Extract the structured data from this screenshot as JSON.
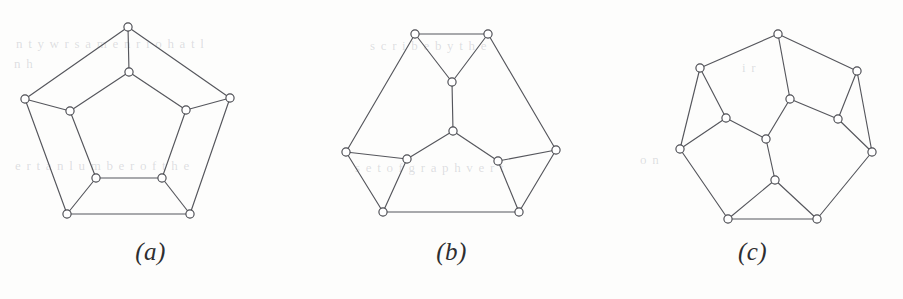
{
  "figure": {
    "background_color": "#fdfdfc",
    "edge_color": "#55565c",
    "node_fill": "#ffffff",
    "node_stroke": "#4a4b51",
    "node_radius": 4.1,
    "caption_color": "#2e2e30",
    "ghost_color": "rgba(145,148,160,0.30)"
  },
  "ghost_marks": [
    {
      "text": "n t  y  w  r  s  a  m  e  n  r  i  o  h  a  t  l",
      "x": 16,
      "y": 36
    },
    {
      "text": "n h",
      "x": 14,
      "y": 56
    },
    {
      "text": "e  r  t  a  n   l   u  m  b  e  r  o  f   t  h  e",
      "x": 15,
      "y": 158
    },
    {
      "text": "s  c  r  i  b  e   b  y   t  h  e",
      "x": 370,
      "y": 38
    },
    {
      "text": "s  e  t   o f   g r a p h   v e r t",
      "x": 355,
      "y": 160
    },
    {
      "text": "i  r",
      "x": 742,
      "y": 60
    },
    {
      "text": "o  n",
      "x": 640,
      "y": 152
    }
  ],
  "panels": [
    {
      "id": "panel-a",
      "caption": "(a)",
      "left": 0,
      "graph_name": "pentagonal-prism-graph",
      "nodes": [
        {
          "name": "outer-top",
          "x": 128,
          "y": 27
        },
        {
          "name": "outer-left",
          "x": 25,
          "y": 99
        },
        {
          "name": "outer-right",
          "x": 230,
          "y": 98
        },
        {
          "name": "outer-bottom-left",
          "x": 67,
          "y": 214
        },
        {
          "name": "outer-bottom-right",
          "x": 190,
          "y": 214
        },
        {
          "name": "inner-top",
          "x": 129,
          "y": 72
        },
        {
          "name": "inner-left",
          "x": 70,
          "y": 111
        },
        {
          "name": "inner-right",
          "x": 186,
          "y": 110
        },
        {
          "name": "inner-bottom-left",
          "x": 96,
          "y": 178
        },
        {
          "name": "inner-bottom-right",
          "x": 162,
          "y": 178
        }
      ],
      "edges": [
        [
          0,
          1
        ],
        [
          0,
          2
        ],
        [
          1,
          3
        ],
        [
          2,
          4
        ],
        [
          3,
          4
        ],
        [
          5,
          6
        ],
        [
          5,
          7
        ],
        [
          6,
          8
        ],
        [
          7,
          9
        ],
        [
          8,
          9
        ],
        [
          0,
          5
        ],
        [
          1,
          6
        ],
        [
          2,
          7
        ],
        [
          3,
          8
        ],
        [
          4,
          9
        ]
      ]
    },
    {
      "id": "panel-b",
      "caption": "(b)",
      "left": 301,
      "graph_name": "hexagonal-three-spoke-graph",
      "nodes": [
        {
          "name": "outer-top-left",
          "x": 114,
          "y": 34
        },
        {
          "name": "outer-top-right",
          "x": 187,
          "y": 34
        },
        {
          "name": "outer-left",
          "x": 45,
          "y": 152
        },
        {
          "name": "outer-right",
          "x": 255,
          "y": 150
        },
        {
          "name": "outer-bottom-left",
          "x": 82,
          "y": 212
        },
        {
          "name": "outer-bottom-right",
          "x": 218,
          "y": 212
        },
        {
          "name": "inner-top",
          "x": 151,
          "y": 82
        },
        {
          "name": "center",
          "x": 152,
          "y": 131
        },
        {
          "name": "inner-left",
          "x": 106,
          "y": 159
        },
        {
          "name": "inner-right",
          "x": 197,
          "y": 161
        }
      ],
      "edges": [
        [
          0,
          1
        ],
        [
          0,
          2
        ],
        [
          1,
          3
        ],
        [
          2,
          4
        ],
        [
          3,
          5
        ],
        [
          4,
          5
        ],
        [
          0,
          6
        ],
        [
          1,
          6
        ],
        [
          6,
          7
        ],
        [
          2,
          8
        ],
        [
          4,
          8
        ],
        [
          8,
          7
        ],
        [
          3,
          9
        ],
        [
          5,
          9
        ],
        [
          9,
          7
        ]
      ]
    },
    {
      "id": "panel-c",
      "caption": "(c)",
      "left": 602,
      "graph_name": "heptagonal-dodecahedral-graph",
      "nodes": [
        {
          "name": "outer-top",
          "x": 176,
          "y": 34
        },
        {
          "name": "outer-upper-left",
          "x": 98,
          "y": 68
        },
        {
          "name": "outer-upper-right",
          "x": 255,
          "y": 71
        },
        {
          "name": "outer-left",
          "x": 78,
          "y": 149
        },
        {
          "name": "outer-right",
          "x": 270,
          "y": 152
        },
        {
          "name": "outer-bottom-left",
          "x": 126,
          "y": 219
        },
        {
          "name": "outer-bottom-right",
          "x": 215,
          "y": 219
        },
        {
          "name": "inner-upper",
          "x": 188,
          "y": 99
        },
        {
          "name": "inner-upper-left",
          "x": 124,
          "y": 118
        },
        {
          "name": "inner-upper-right",
          "x": 236,
          "y": 119
        },
        {
          "name": "inner-center",
          "x": 164,
          "y": 139
        },
        {
          "name": "inner-lower",
          "x": 173,
          "y": 180
        }
      ],
      "edges": [
        [
          0,
          1
        ],
        [
          0,
          2
        ],
        [
          1,
          3
        ],
        [
          2,
          4
        ],
        [
          3,
          5
        ],
        [
          4,
          6
        ],
        [
          5,
          6
        ],
        [
          0,
          7
        ],
        [
          7,
          9
        ],
        [
          7,
          10
        ],
        [
          1,
          8
        ],
        [
          8,
          3
        ],
        [
          8,
          10
        ],
        [
          2,
          9
        ],
        [
          9,
          4
        ],
        [
          10,
          11
        ],
        [
          11,
          5
        ],
        [
          11,
          6
        ]
      ]
    }
  ]
}
